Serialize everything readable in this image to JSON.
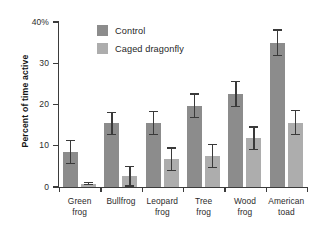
{
  "chart_data": {
    "type": "bar",
    "title": "",
    "subtitle": "",
    "xlabel": "",
    "ylabel": "Percent of time active",
    "ylim": [
      0,
      40
    ],
    "yticks": [
      0,
      10,
      20,
      30,
      40
    ],
    "ytick_labels": [
      "0",
      "10",
      "20",
      "30",
      "40%"
    ],
    "grid": false,
    "legend_position": "upper left (inside plot)",
    "grouping": "grouped",
    "error_bars": "symmetric, shown as capped whiskers",
    "categories": [
      "Green frog",
      "Bullfrog",
      "Leopard frog",
      "Tree frog",
      "Wood frog",
      "American toad"
    ],
    "category_lines": [
      [
        "Green",
        "frog"
      ],
      [
        "Bullfrog",
        ""
      ],
      [
        "Leopard",
        "frog"
      ],
      [
        "Tree",
        "frog"
      ],
      [
        "Wood",
        "frog"
      ],
      [
        "American",
        "toad"
      ]
    ],
    "series": [
      {
        "name": "Control",
        "color": "#8c8c8c",
        "values": [
          8.5,
          15.4,
          15.5,
          19.7,
          22.5,
          35.0
        ],
        "errors": [
          2.9,
          2.8,
          2.9,
          3.0,
          3.2,
          3.2
        ]
      },
      {
        "name": "Caged dragonfly",
        "color": "#adadad",
        "values": [
          0.8,
          2.6,
          6.7,
          7.5,
          11.8,
          15.6
        ],
        "errors": [
          0.4,
          2.5,
          2.9,
          2.9,
          2.9,
          3.0
        ]
      }
    ]
  },
  "legend": {
    "items": [
      {
        "label": "Control",
        "color": "#8c8c8c"
      },
      {
        "label": "Caged dragonfly",
        "color": "#adadad"
      }
    ]
  },
  "axes": {
    "y_title": "Percent of time active",
    "y_tick_labels": [
      "40%",
      "30",
      "20",
      "10",
      "0"
    ]
  },
  "colors": {
    "control": "#8c8c8c",
    "caged_dragonfly": "#adadad",
    "axis": "#3b3b3b",
    "error_bar": "#3a3a3a",
    "background": "#ffffff",
    "text": "#1f1f1f"
  }
}
